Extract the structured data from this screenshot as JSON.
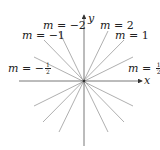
{
  "diagram": {
    "title": "",
    "axes": {
      "x_label": "x",
      "y_label": "y"
    },
    "origin_px": [
      84,
      81
    ],
    "lines": [
      {
        "slope": "2",
        "label": "m = 2"
      },
      {
        "slope": "1",
        "label": "m = 1"
      },
      {
        "slope": "1/2",
        "label": "m = 1/2"
      },
      {
        "slope": "-2",
        "label": "m = −2"
      },
      {
        "slope": "-1",
        "label": "m = −1"
      },
      {
        "slope": "-1/2",
        "label": "m = −1/2"
      }
    ],
    "labels": {
      "m_var": "m",
      "eq": " = ",
      "m2": "2",
      "m1": "1",
      "mneg2": "−2",
      "mneg1": "−1",
      "neg_sign": "−",
      "half_num": "1",
      "half_den": "2"
    },
    "colors": {
      "lines": "#9a9a9a",
      "axes": "#555555",
      "text": "#222222"
    }
  }
}
